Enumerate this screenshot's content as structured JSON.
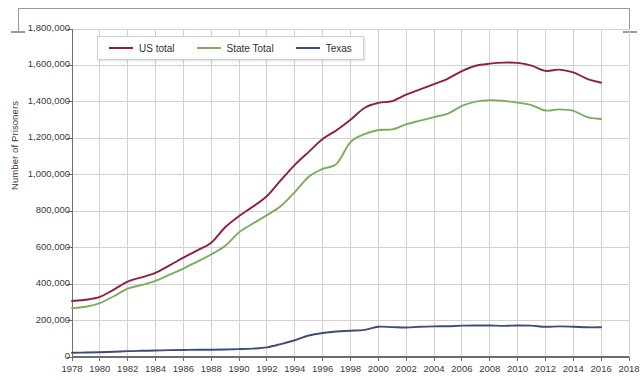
{
  "axes": {
    "ylabel": "Number of Prisoners",
    "yticks": [
      "0",
      "200,000",
      "400,000",
      "600,000",
      "800,000",
      "1,000,000",
      "1,200,000",
      "1,400,000",
      "1,600,000",
      "1,800,000"
    ],
    "xticks": [
      "1978",
      "1980",
      "1982",
      "1984",
      "1986",
      "1988",
      "1990",
      "1992",
      "1994",
      "1996",
      "1998",
      "2000",
      "2002",
      "2004",
      "2006",
      "2008",
      "2010",
      "2012",
      "2014",
      "2016",
      "2018"
    ]
  },
  "legend": {
    "entries": [
      {
        "label": "US total",
        "color": "#8e1f3f"
      },
      {
        "label": "State Total",
        "color": "#7aae5c"
      },
      {
        "label": "Texas",
        "color": "#3d4d79"
      }
    ]
  },
  "colors": {
    "us_total": "#8e1f3f",
    "state_total": "#7aae5c",
    "texas": "#3d4d79",
    "gridline": "#d2d2d2",
    "axis": "#6e6e6e",
    "background": "#ffffff"
  },
  "chart_data": {
    "type": "line",
    "title": "",
    "xlabel": "",
    "ylabel": "Number of Prisoners",
    "xlim": [
      1978,
      2018
    ],
    "ylim": [
      0,
      1800000
    ],
    "grid": true,
    "legend_position": "top-left-inside",
    "x": [
      1978,
      1979,
      1980,
      1981,
      1982,
      1983,
      1984,
      1985,
      1986,
      1987,
      1988,
      1989,
      1990,
      1991,
      1992,
      1993,
      1994,
      1995,
      1996,
      1997,
      1998,
      1999,
      2000,
      2001,
      2002,
      2003,
      2004,
      2005,
      2006,
      2007,
      2008,
      2009,
      2010,
      2011,
      2012,
      2013,
      2014,
      2015,
      2016
    ],
    "series": [
      {
        "name": "US total",
        "color": "#8e1f3f",
        "values": [
          307276,
          314006,
          329821,
          369930,
          413806,
          437248,
          462002,
          502507,
          544972,
          585292,
          627402,
          712364,
          773919,
          825559,
          883593,
          970444,
          1054702,
          1125874,
          1196146,
          1244554,
          1302019,
          1366721,
          1394231,
          1404032,
          1440144,
          1468601,
          1497100,
          1527929,
          1568674,
          1598316,
          1609759,
          1615487,
          1613803,
          1598780,
          1570397,
          1576950,
          1561525,
          1526792,
          1505400
        ]
      },
      {
        "name": "State Total",
        "color": "#7aae5c",
        "values": [
          268000,
          276000,
          295819,
          333251,
          375603,
          394953,
          417845,
          451812,
          485553,
          523922,
          562605,
          610000,
          684544,
          732565,
          778495,
          828566,
          904647,
          989004,
          1032440,
          1059588,
          1178978,
          1222454,
          1245845,
          1249181,
          1277127,
          1296986,
          1316772,
          1335716,
          1377815,
          1401515,
          1409674,
          1405622,
          1395695,
          1382418,
          1352582,
          1358875,
          1350958,
          1316205,
          1306000
        ]
      },
      {
        "name": "Texas",
        "color": "#3d4d79",
        "values": [
          23000,
          24500,
          26000,
          28500,
          32000,
          34000,
          35500,
          37500,
          38500,
          39500,
          40000,
          41000,
          43000,
          46000,
          53000,
          71000,
          92000,
          118000,
          132000,
          140000,
          144000,
          149000,
          166000,
          164000,
          162000,
          166000,
          168000,
          169000,
          172000,
          173000,
          173000,
          171000,
          173000,
          172000,
          166000,
          168000,
          166000,
          163000,
          163000
        ]
      }
    ]
  }
}
